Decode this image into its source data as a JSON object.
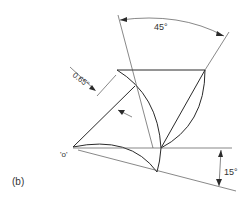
{
  "figure": {
    "label": "(b)",
    "annotations": {
      "angle_top": "45°",
      "angle_right": "15°",
      "offset": "0.65\"",
      "point": "'o'"
    },
    "colors": {
      "line": "#2a2a2a",
      "background": "#ffffff"
    }
  }
}
